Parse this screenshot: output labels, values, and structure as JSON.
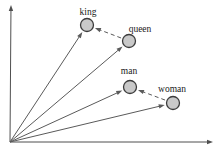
{
  "diagram": {
    "canvas": {
      "width": 222,
      "height": 154,
      "background": "#ffffff"
    },
    "colors": {
      "axis": "#4f4f4f",
      "vector": "#5a5a5a",
      "dashed_arrow": "#5a5a5a",
      "node_fill": "#c9c9c9",
      "node_stroke": "#3c3c3c",
      "label": "#1a1a1a"
    },
    "origin": {
      "x": 10,
      "y": 142
    },
    "axes": {
      "x_end": {
        "x": 213,
        "y": 142
      },
      "y_end": {
        "x": 11,
        "y": 5
      }
    },
    "node_radius": 6.5,
    "nodes": [
      {
        "id": "king",
        "label": "king",
        "x": 87,
        "y": 25,
        "label_x": 88,
        "label_y": 15
      },
      {
        "id": "queen",
        "label": "queen",
        "x": 129,
        "y": 41,
        "label_x": 140,
        "label_y": 32
      },
      {
        "id": "man",
        "label": "man",
        "x": 130,
        "y": 87,
        "label_x": 129,
        "label_y": 74
      },
      {
        "id": "woman",
        "label": "woman",
        "x": 173,
        "y": 103,
        "label_x": 172,
        "label_y": 92
      }
    ],
    "vectors": [
      {
        "from": "origin",
        "to": "king"
      },
      {
        "from": "origin",
        "to": "queen"
      },
      {
        "from": "origin",
        "to": "man"
      },
      {
        "from": "origin",
        "to": "woman"
      }
    ],
    "analogy_arrows": [
      {
        "from": "queen",
        "to": "king",
        "style": "dashed"
      },
      {
        "from": "woman",
        "to": "man",
        "style": "dashed"
      }
    ]
  }
}
